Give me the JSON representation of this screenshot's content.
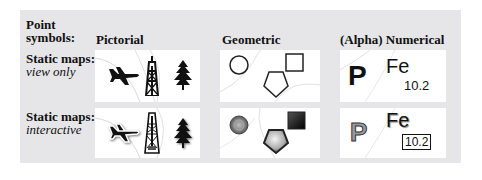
{
  "header": {
    "row_title_line1": "Point",
    "row_title_line2": "symbols:",
    "columns": [
      {
        "label": "Pictorial"
      },
      {
        "label": "Geometric"
      },
      {
        "label": "(Alpha) Numerical"
      }
    ]
  },
  "rows": [
    {
      "title": "Static maps:",
      "subtitle": "view only"
    },
    {
      "title": "Static maps:",
      "subtitle": "interactive"
    }
  ],
  "symbols": {
    "pictorial": [
      "airplane-icon",
      "oil-derrick-icon",
      "pine-tree-icon"
    ],
    "geometric": [
      "circle",
      "square",
      "pentagon"
    ],
    "alphanumeric": {
      "letter": "P",
      "element": "Fe",
      "value": "10.2"
    }
  },
  "colors": {
    "panel": "#e6e6e8",
    "tile": "#ffffff",
    "ink": "#111111",
    "interactive_fill": "#9a9a9a"
  }
}
